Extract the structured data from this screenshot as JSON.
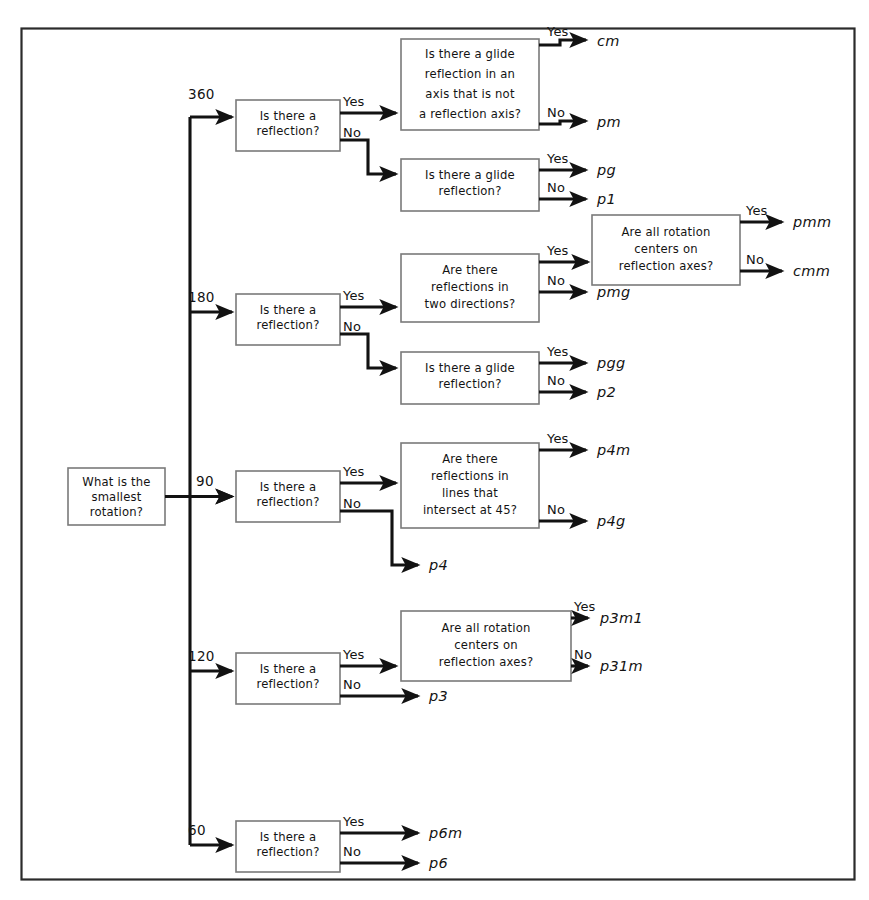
{
  "diagram": {
    "frame": {
      "color": "#2b2b2b"
    },
    "colors": {
      "background": "#ffffff",
      "line": "#121212",
      "box_border": "#7a7a7a",
      "frame": "#2b2b2b",
      "text": "#131313"
    },
    "start": {
      "label_line1": "What is the",
      "label_line2": "smallest",
      "label_line3": "rotation?"
    },
    "branches": [
      {
        "value": "360"
      },
      {
        "value": "180"
      },
      {
        "value": "90"
      },
      {
        "value": "120"
      },
      {
        "value": "60"
      }
    ],
    "edge_labels": {
      "yes": "Yes",
      "no": "No"
    },
    "questions": {
      "reflection": {
        "l1": "Is there a",
        "l2": "reflection?"
      },
      "glide_axis_not_reflection": {
        "l1": "Is there a glide",
        "l2": "reflection in an",
        "l3": "axis that is not",
        "l4": "a reflection axis?"
      },
      "glide_reflection": {
        "l1": "Is there a glide",
        "l2": "reflection?"
      },
      "two_directions": {
        "l1": "Are there",
        "l2": "reflections in",
        "l3": "two directions?"
      },
      "rotation_centers": {
        "l1": "Are all rotation",
        "l2": "centers on",
        "l3": "reflection axes?"
      },
      "intersect_45": {
        "l1": "Are there",
        "l2": "reflections in",
        "l3": "lines that",
        "l4": "intersect at 45?"
      },
      "rotation_centers_3": {
        "l1": "Are all rotation",
        "l2": "centers on",
        "l3": "reflection axes?"
      }
    },
    "results": {
      "cm": "cm",
      "pm": "pm",
      "pg": "pg",
      "p1": "p1",
      "pmm": "pmm",
      "cmm": "cmm",
      "pmg": "pmg",
      "pgg": "pgg",
      "p2": "p2",
      "p4m": "p4m",
      "p4g": "p4g",
      "p4": "p4",
      "p3m1": "p3m1",
      "p31m": "p31m",
      "p3": "p3",
      "p6m": "p6m",
      "p6": "p6"
    }
  }
}
